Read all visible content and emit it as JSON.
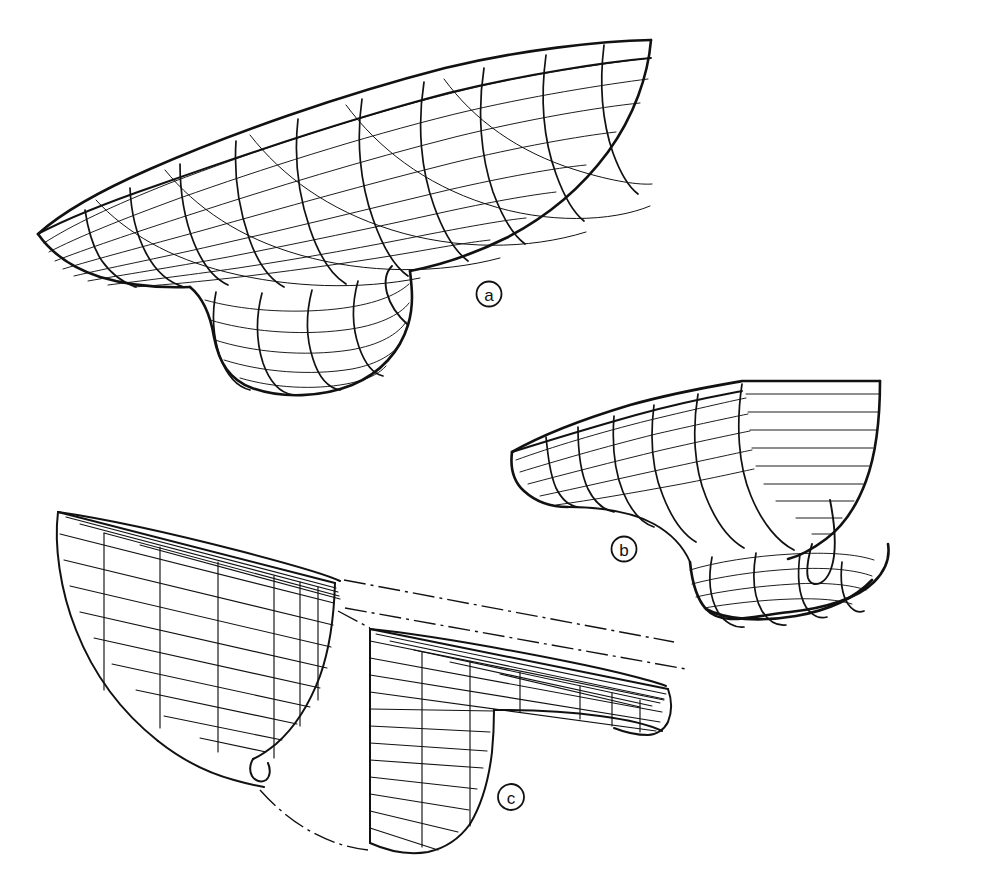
{
  "figure": {
    "kind": "technical-line-drawing",
    "background_color": "#ffffff",
    "line_color": "#111111",
    "width_px": 996,
    "height_px": 893
  },
  "panels": [
    {
      "id": "a",
      "label": "a",
      "label_style": "circled-lowercase-letter",
      "label_x": 489,
      "label_y": 294,
      "description": "Smooth curved wireframe of forebody hull with bulbous bow, viewed from forward-below-port quarter",
      "mesh": {
        "type": "curved-surface-wireframe",
        "station_count": 11,
        "waterline_count": 8,
        "buttock_count": 4,
        "has_bulbous_bow": true
      },
      "bounds": {
        "x": 34,
        "y": 36,
        "width": 622,
        "height": 352
      }
    },
    {
      "id": "b",
      "label": "b",
      "label_style": "circled-lowercase-letter",
      "label_x": 624,
      "label_y": 549,
      "description": "Same hull surface viewed more nearly from ahead, showing the bulb and transverse section fullness",
      "mesh": {
        "type": "curved-surface-wireframe",
        "station_count": 10,
        "waterline_count": 9,
        "buttock_count": 2,
        "has_bulbous_bow": true
      },
      "bounds": {
        "x": 506,
        "y": 378,
        "width": 448,
        "height": 240
      }
    },
    {
      "id": "c",
      "label": "c",
      "label_style": "circled-lowercase-letter",
      "label_x": 511,
      "label_y": 797,
      "description": "Exploded faceted/panelized approximation of the same hull, split into aft block and forward bulb block, joined by dash-dot construction lines",
      "mesh": {
        "type": "faceted-panel-wireframe",
        "pieces": 2,
        "piece_names": [
          "aft-block",
          "forward-bulb-block"
        ],
        "connector_line_style": "dash-dot chain line",
        "connector_count": 3
      },
      "bounds": {
        "x": 52,
        "y": 505,
        "width": 620,
        "height": 350
      }
    }
  ],
  "legend": {
    "line_types": [
      {
        "name": "hull-outline",
        "style": "heavy continuous",
        "meaning": "hull profile / sheer edge"
      },
      {
        "name": "station-line",
        "style": "medium continuous",
        "meaning": "transverse station"
      },
      {
        "name": "waterline",
        "style": "thin continuous",
        "meaning": "longitudinal waterline"
      },
      {
        "name": "buttock-line",
        "style": "thin continuous",
        "meaning": "buttock / diagonal"
      },
      {
        "name": "chain-line",
        "style": "dash-dot",
        "meaning": "construction / alignment reference"
      }
    ]
  }
}
